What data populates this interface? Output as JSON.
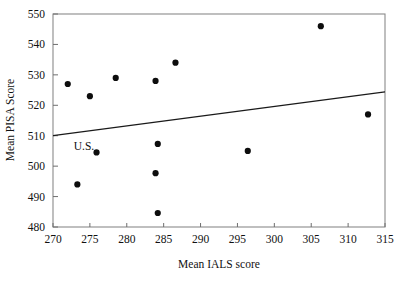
{
  "chart_data": {
    "type": "scatter",
    "title": "",
    "xlabel": "Mean IALS score",
    "ylabel": "Mean PISA Score",
    "xlim": [
      270,
      315
    ],
    "ylim": [
      480,
      550
    ],
    "xticks": [
      270,
      275,
      280,
      285,
      290,
      295,
      300,
      305,
      310,
      315
    ],
    "yticks": [
      480,
      490,
      500,
      510,
      520,
      530,
      540,
      550
    ],
    "xtick_labels": [
      "270",
      "275",
      "280",
      "285",
      "290",
      "295",
      "300",
      "305",
      "310",
      "315"
    ],
    "ytick_labels": [
      "480",
      "490",
      "500",
      "510",
      "520",
      "530",
      "540",
      "550"
    ],
    "grid": false,
    "legend": null,
    "marker": "filled-circle",
    "marker_color": "#0d0d0d",
    "points": [
      {
        "x": 272.0,
        "y": 527.0,
        "label": ""
      },
      {
        "x": 273.3,
        "y": 494.0,
        "label": ""
      },
      {
        "x": 275.0,
        "y": 523.0,
        "label": ""
      },
      {
        "x": 275.9,
        "y": 504.5,
        "label": "U.S."
      },
      {
        "x": 278.5,
        "y": 529.0,
        "label": ""
      },
      {
        "x": 283.9,
        "y": 528.0,
        "label": ""
      },
      {
        "x": 284.2,
        "y": 507.3,
        "label": ""
      },
      {
        "x": 283.9,
        "y": 497.7,
        "label": ""
      },
      {
        "x": 284.2,
        "y": 484.6,
        "label": ""
      },
      {
        "x": 286.6,
        "y": 534.0,
        "label": ""
      },
      {
        "x": 296.4,
        "y": 505.0,
        "label": ""
      },
      {
        "x": 306.3,
        "y": 546.0,
        "label": ""
      },
      {
        "x": 312.7,
        "y": 517.0,
        "label": ""
      }
    ],
    "annotations": [
      {
        "text": "U.S.",
        "x": 274.2,
        "y": 505.2
      }
    ],
    "trend_line": {
      "label": "",
      "x0": 270.0,
      "y0": 510.0,
      "x1": 315.0,
      "y1": 524.4,
      "color": "#1a1a1a"
    }
  }
}
